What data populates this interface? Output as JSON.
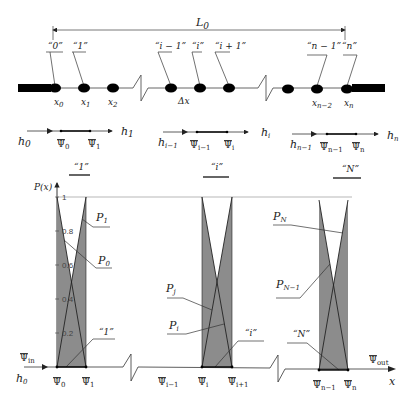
{
  "diagram": {
    "length_label": "L",
    "length_sub": "0",
    "node_labels": [
      {
        "text": "“0”",
        "x": 48,
        "y": 50
      },
      {
        "text": "“1”",
        "x": 76,
        "y": 50
      },
      {
        "text": "“i − 1”",
        "x": 155,
        "y": 50
      },
      {
        "text": "“i”",
        "x": 192,
        "y": 50
      },
      {
        "text": "“i + 1”",
        "x": 217,
        "y": 50
      },
      {
        "text": "“n − 1”",
        "x": 307,
        "y": 50
      },
      {
        "text": "“n”",
        "x": 341,
        "y": 50
      }
    ],
    "node_axis_labels": {
      "x0": "x",
      "x0_sub": "0",
      "x1": "x",
      "x1_sub": "1",
      "x2": "x",
      "x2_sub": "2",
      "dx": "Δx",
      "xn2": "x",
      "xn2_sub": "n−2",
      "xn": "x",
      "xn_sub": "n"
    },
    "flux_rows": {
      "h0": "h",
      "h0_sub": "0",
      "h1": "h",
      "h1_sub": "1",
      "hi1": "h",
      "hi1_sub": "i−1",
      "hi": "h",
      "hi_sub": "i",
      "hn1": "h",
      "hn1_sub": "n−1",
      "hn": "h",
      "hn_sub": "n",
      "psi0": "Ψ",
      "psi0_sub": "0",
      "psi1": "Ψ",
      "psi1_sub": "1",
      "psii1": "Ψ",
      "psii1_sub": "i−1",
      "psii": "Ψ",
      "psii_sub": "i",
      "psin1": "Ψ",
      "psin1_sub": "n−1",
      "psin": "Ψ",
      "psin_sub": "n"
    },
    "element_labels": {
      "first": "“1”",
      "middle": "“i”",
      "last": "“N”"
    },
    "chart": {
      "y_axis_label": "P(x)",
      "x_axis_label": "x",
      "y_ticks": [
        "1",
        "0.8",
        "0.6",
        "0.4",
        "0.2"
      ],
      "curve_labels": {
        "P1": "P",
        "P1_sub": "1",
        "P0": "P",
        "P0_sub": "0",
        "Pj": "P",
        "Pj_sub": "j",
        "Pi": "P",
        "Pi_sub": "i",
        "PN": "P",
        "PN_sub": "N",
        "PN1": "P",
        "PN1_sub": "N−1"
      },
      "inlet_label": "Ψ",
      "inlet_sub": "in",
      "outlet_label": "Ψ",
      "outlet_sub": "out",
      "h0": "h",
      "h0_sub": "0",
      "x_ticks": {
        "psi0": "Ψ",
        "psi0_sub": "0",
        "psi1": "Ψ",
        "psi1_sub": "1",
        "psii1": "Ψ",
        "psii1_sub": "i−1",
        "psii": "Ψ",
        "psii_sub": "i",
        "psii_1": "Ψ",
        "psii_1_sub": "i+1",
        "psin1": "Ψ",
        "psin1_sub": "n−1",
        "psin": "Ψ",
        "psin_sub": "n"
      }
    },
    "colors": {
      "fill": "#8c8c8c",
      "line": "#222222",
      "bar": "#000000"
    }
  }
}
